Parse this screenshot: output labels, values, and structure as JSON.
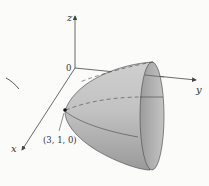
{
  "diagram": {
    "type": "3D surface (elliptic paraboloid) with coordinate axes",
    "axes": {
      "x_label": "x",
      "y_label": "y",
      "z_label": "z",
      "origin_label": "0"
    },
    "point_label": "(3, 1, 0)",
    "colors": {
      "surface": "#b8b8b8",
      "surface_dark": "#8e8e8e",
      "rim": "#a9a9a9",
      "axis": "#444444",
      "background": "#fbfbfa"
    }
  }
}
